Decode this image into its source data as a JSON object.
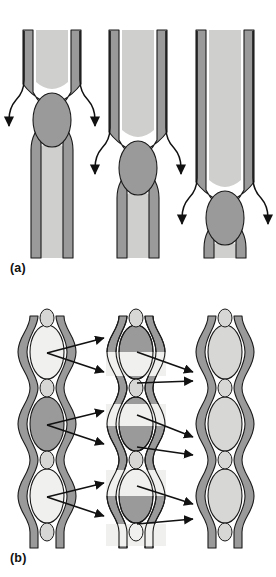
{
  "figure": {
    "background": "#ffffff"
  },
  "panels": [
    {
      "id": "a",
      "label": "(a)",
      "description": "Three duplex strips in which a pair of flanking strands cross over and enclose an open loop; the crossover point descends from left to right.",
      "columns": [
        {
          "name": "stage-1",
          "crossover_y": 88,
          "loop_center_y": 118,
          "x_center": 52
        },
        {
          "name": "stage-2",
          "crossover_y": 136,
          "loop_center_y": 166,
          "x_center": 138
        },
        {
          "name": "stage-3",
          "crossover_y": 186,
          "loop_center_y": 216,
          "x_center": 224
        }
      ],
      "arrow_count_per_column": 2,
      "arrow_direction": "down-outward"
    },
    {
      "id": "b",
      "label": "(b)",
      "description": "Three chains of stacked loops. Left chain: loops alternate pale, dark, pale. Middle chain: loops are split into dark and pale horizontal bands. Right chain: all loops uniformly pale.",
      "chains": [
        {
          "name": "chain-left",
          "x_center": 47,
          "loops": [
            {
              "index": 1,
              "fill": "pale"
            },
            {
              "index": 2,
              "fill": "dark"
            },
            {
              "index": 3,
              "fill": "pale"
            }
          ]
        },
        {
          "name": "chain-middle",
          "x_center": 136,
          "loops": [
            {
              "index": 1,
              "fill": "split-dark-top-pale-bottom"
            },
            {
              "index": 2,
              "fill": "split-pale-top-dark-bottom"
            },
            {
              "index": 3,
              "fill": "split-dark-top-pale-bottom"
            },
            {
              "index": 4,
              "fill": "split-pale-top-dark-bottom"
            }
          ]
        },
        {
          "name": "chain-right",
          "x_center": 225,
          "loops": [
            {
              "index": 1,
              "fill": "pale"
            },
            {
              "index": 2,
              "fill": "pale"
            },
            {
              "index": 3,
              "fill": "pale"
            }
          ]
        }
      ],
      "arrows": {
        "group_count": 6,
        "description": "Pairs of straight arrows fan from each left-chain loop to two middle-chain loops, and from middle-chain loops to right-chain loops."
      }
    }
  ],
  "colors": {
    "band_dark": "#9a9a9a",
    "band_mid": "#a8a8a8",
    "loop_pale": "#f0f0ee",
    "loop_light": "#d7d7d5",
    "channel_light": "#cfcfcd",
    "outline": "#1a1a1a",
    "text": "#111111",
    "background": "#ffffff"
  }
}
